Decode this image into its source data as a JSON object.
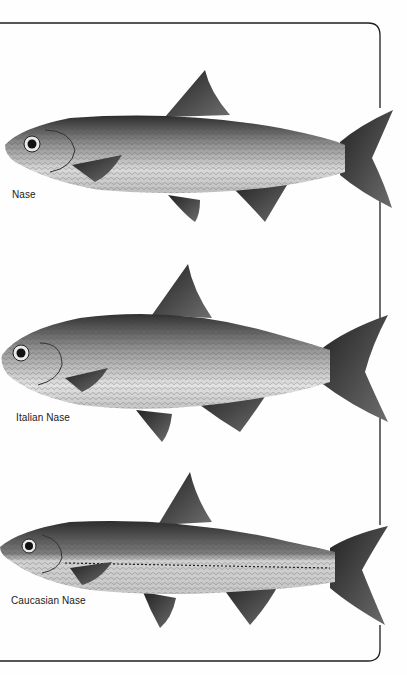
{
  "page": {
    "background": "#fefefe",
    "frame_color": "#1e1e1e"
  },
  "illustrations": [
    {
      "name": "Nase",
      "caption": "Nase"
    },
    {
      "name": "Italian Nase",
      "caption": "Italian Nase"
    },
    {
      "name": "Caucasian Nase",
      "caption": "Caucasian Nase"
    }
  ]
}
